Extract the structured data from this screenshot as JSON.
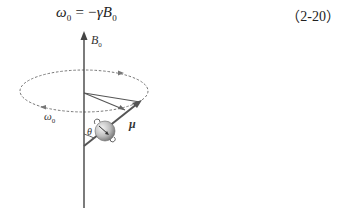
{
  "equation": {
    "lhs_symbol": "ω",
    "lhs_subscript": "0",
    "operator": " = −",
    "rhs_gamma": "γ",
    "rhs_symbol": "B",
    "rhs_subscript": "0",
    "number": "（2-20）"
  },
  "figure": {
    "labels": {
      "field": "B",
      "field_subscript": "0",
      "precession": "ω",
      "precession_subscript": "0",
      "angle": "θ",
      "moment": "μ"
    },
    "colors": {
      "axis": "#444444",
      "ellipse": "#666666",
      "vector": "#555555",
      "sphere_light": "#f2f2f2",
      "sphere_dark": "#6a6a6a"
    }
  }
}
